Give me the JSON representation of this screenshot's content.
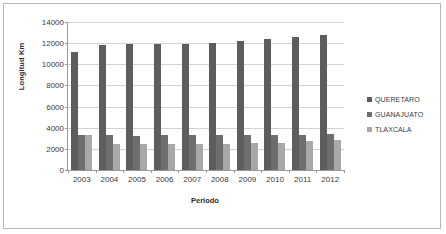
{
  "chart_data": {
    "type": "bar",
    "title": "",
    "xlabel": "Periodo",
    "ylabel": "Longitud Km",
    "categories": [
      "2003",
      "2004",
      "2005",
      "2006",
      "2007",
      "2008",
      "2009",
      "2010",
      "2011",
      "2012"
    ],
    "series": [
      {
        "name": "QUERETARO",
        "color": "#5d5d5d",
        "values": [
          11200,
          11800,
          11950,
          11900,
          11880,
          12050,
          12250,
          12400,
          12600,
          12800
        ]
      },
      {
        "name": "GUANAJUATO",
        "color": "#6e6e6e",
        "values": [
          3350,
          3350,
          3250,
          3300,
          3300,
          3300,
          3300,
          3300,
          3350,
          3400
        ]
      },
      {
        "name": "TLAXCALA",
        "color": "#a8a8a8",
        "values": [
          3350,
          2450,
          2450,
          2480,
          2480,
          2500,
          2520,
          2550,
          2700,
          2800
        ]
      }
    ],
    "ylim": [
      0,
      14000
    ],
    "yticks": [
      0,
      2000,
      4000,
      6000,
      8000,
      10000,
      12000,
      14000
    ],
    "grid": true,
    "legend_position": "right"
  }
}
